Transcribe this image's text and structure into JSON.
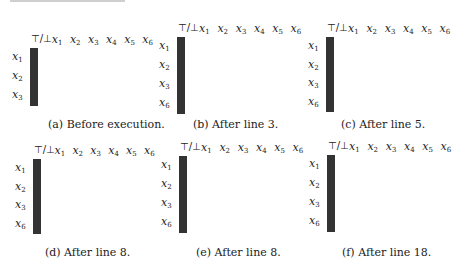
{
  "corner_label": "⊤/⊥",
  "columns": [
    "x1",
    "x2",
    "x3",
    "x4",
    "x5",
    "x6"
  ],
  "panels": [
    {
      "id": "a",
      "caption": "(a) Before execution.",
      "rows": [
        "x1",
        "x2",
        "x3"
      ],
      "cells": [
        [
          1,
          0,
          0,
          0,
          1,
          1,
          1
        ],
        [
          1,
          0,
          0,
          0,
          0,
          1,
          1
        ],
        [
          1,
          0,
          0,
          0,
          0,
          1,
          0
        ]
      ]
    },
    {
      "id": "b",
      "caption": "(b) After line 3.",
      "rows": [
        "x1",
        "x2",
        "x3",
        "x6"
      ],
      "cells": [
        [
          1,
          0,
          0,
          0,
          1,
          1,
          1
        ],
        [
          1,
          0,
          0,
          0,
          0,
          1,
          1
        ],
        [
          1,
          0,
          0,
          0,
          0,
          1,
          0
        ],
        [
          1,
          0,
          0,
          0,
          0,
          0,
          0
        ]
      ]
    },
    {
      "id": "c",
      "caption": "(c) After line 5.",
      "rows": [
        "x1",
        "x2",
        "x3",
        "x6"
      ],
      "cells": [
        [
          1,
          0,
          0,
          0,
          1,
          1,
          1
        ],
        [
          1,
          0,
          0,
          0,
          0,
          1,
          1
        ],
        [
          1,
          0,
          0,
          0,
          0,
          1,
          0
        ],
        [
          1,
          0,
          0,
          0,
          0,
          0,
          1
        ]
      ]
    },
    {
      "id": "d",
      "caption": "(d) After line 8.",
      "rows": [
        "x1",
        "x2",
        "x3",
        "x6"
      ],
      "cells": [
        [
          0,
          0,
          0,
          0,
          1,
          1,
          0
        ],
        [
          1,
          0,
          0,
          0,
          0,
          1,
          1
        ],
        [
          1,
          0,
          0,
          0,
          0,
          1,
          0
        ],
        [
          1,
          0,
          0,
          0,
          0,
          0,
          1
        ]
      ]
    },
    {
      "id": "e",
      "caption": "(e) After line 8.",
      "rows": [
        "x1",
        "x2",
        "x3",
        "x6"
      ],
      "cells": [
        [
          0,
          0,
          0,
          0,
          1,
          1,
          0
        ],
        [
          0,
          0,
          0,
          0,
          0,
          1,
          0
        ],
        [
          1,
          0,
          0,
          0,
          0,
          1,
          0
        ],
        [
          1,
          0,
          0,
          0,
          0,
          0,
          1
        ]
      ]
    },
    {
      "id": "f",
      "caption": "(f) After line 18.",
      "rows": [
        "x1",
        "x2",
        "x3",
        "x6"
      ],
      "cells": [
        [
          0,
          0,
          0,
          0,
          1,
          1,
          0
        ],
        [
          0,
          0,
          0,
          0,
          0,
          1,
          0
        ],
        [
          1,
          0,
          0,
          0,
          0,
          1,
          0
        ],
        [
          1,
          0,
          0,
          0,
          0,
          0,
          0
        ]
      ]
    }
  ],
  "colors": {
    "filled": "#6b6b6b",
    "empty": "#ffffff",
    "border": "#333333"
  }
}
